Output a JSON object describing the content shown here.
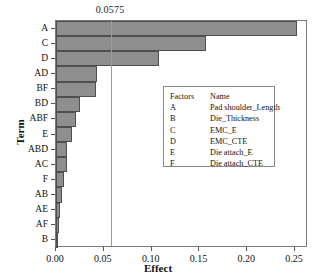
{
  "chart_data": {
    "type": "bar",
    "orientation": "horizontal",
    "title": "",
    "xlabel": "Effect",
    "ylabel": "Term",
    "categories": [
      "A",
      "C",
      "D",
      "AD",
      "BF",
      "BD",
      "ABF",
      "E",
      "ABD",
      "AC",
      "F",
      "AB",
      "AE",
      "AF",
      "B"
    ],
    "values": [
      0.252,
      0.157,
      0.108,
      0.043,
      0.042,
      0.025,
      0.021,
      0.017,
      0.012,
      0.011,
      0.008,
      0.006,
      0.004,
      0.003,
      0.002
    ],
    "xlim": [
      0.0,
      0.2635
    ],
    "ylim": [
      0,
      15
    ],
    "xticks": [
      0.0,
      0.05,
      0.1,
      0.15,
      0.2,
      0.25
    ],
    "xtick_labels": [
      "0.00",
      "0.05",
      "0.10",
      "0.15",
      "0.20",
      "0.25"
    ],
    "grid": false,
    "legend_position": "center-right",
    "reference_line": {
      "value": 0.0575,
      "label": "0.0575",
      "orientation": "vertical"
    },
    "bar_color": "#8e8e8e",
    "bar_edge_color": "#4f4f4f"
  },
  "legend": {
    "header": {
      "key": "Factors",
      "name": "Name"
    },
    "rows": [
      {
        "key": "A",
        "name": "Pad shoulder_Length"
      },
      {
        "key": "B",
        "name": "Die_Thickness"
      },
      {
        "key": "C",
        "name": "EMC_E"
      },
      {
        "key": "D",
        "name": "EMC_CTE"
      },
      {
        "key": "E",
        "name": "Die attach_E"
      },
      {
        "key": "F",
        "name": "Die attach_CTE"
      }
    ]
  }
}
